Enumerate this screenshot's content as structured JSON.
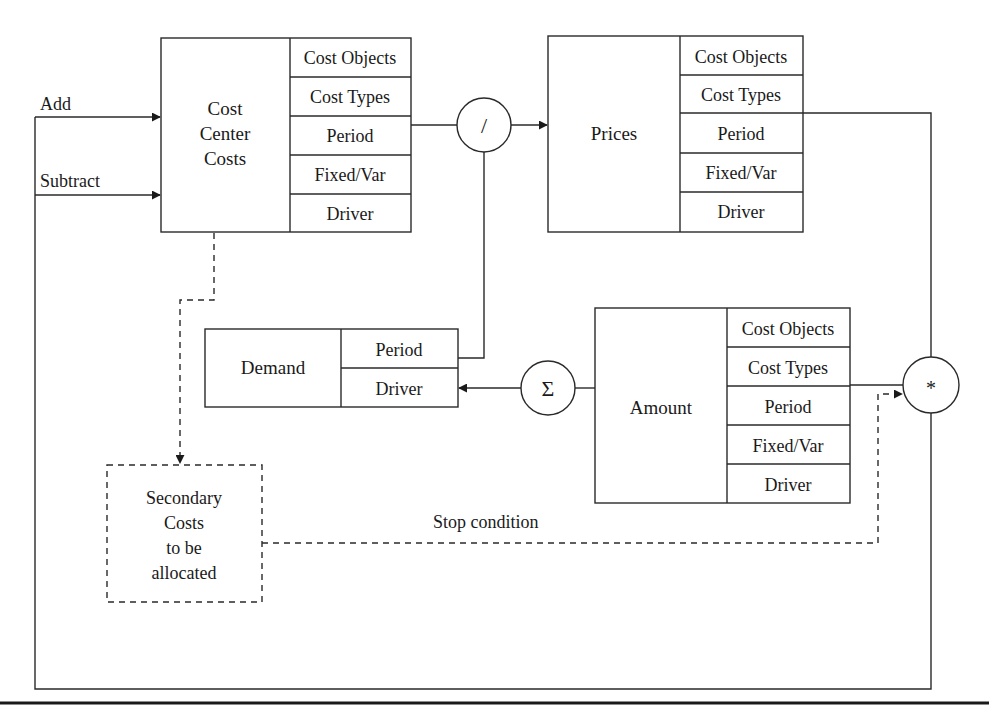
{
  "diagram": {
    "inputs": {
      "add_label": "Add",
      "subtract_label": "Subtract"
    },
    "cost_center_costs": {
      "title_lines": [
        "Cost",
        "Center",
        "Costs"
      ],
      "dimensions": [
        "Cost Objects",
        "Cost Types",
        "Period",
        "Fixed/Var",
        "Driver"
      ]
    },
    "divide_operator": {
      "symbol": "/"
    },
    "prices": {
      "title": "Prices",
      "dimensions": [
        "Cost Objects",
        "Cost Types",
        "Period",
        "Fixed/Var",
        "Driver"
      ]
    },
    "demand": {
      "title": "Demand",
      "dimensions": [
        "Period",
        "Driver"
      ]
    },
    "sum_operator": {
      "symbol": "Σ"
    },
    "amount": {
      "title": "Amount",
      "dimensions": [
        "Cost Objects",
        "Cost Types",
        "Period",
        "Fixed/Var",
        "Driver"
      ]
    },
    "multiply_operator": {
      "symbol": "*"
    },
    "secondary_costs": {
      "title_lines": [
        "Secondary",
        "Costs",
        "to be",
        "allocated"
      ]
    },
    "stop_condition_label": "Stop condition"
  }
}
